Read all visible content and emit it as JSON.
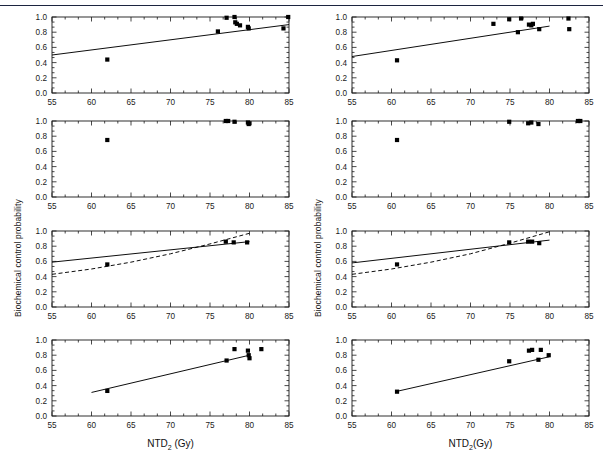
{
  "figure": {
    "ylabel": "Biochemical control probability",
    "xlabel_left": "NTD2 (Gy)",
    "xlabel_right": "NTD2(Gy)",
    "xlabel_base": "NTD",
    "xlabel_sub": "2",
    "xlabel_left_unit": " (Gy)",
    "xlabel_right_unit": "(Gy)",
    "marker_color": "#000000",
    "line_color": "#000000",
    "axis_color": "#1a1a1a",
    "top_rule_color": "#2b3555"
  },
  "axes": {
    "xlim": [
      55,
      85
    ],
    "ylim": [
      0.0,
      1.0
    ],
    "xticks": [
      55,
      60,
      65,
      70,
      75,
      80,
      85
    ],
    "xticklabels": [
      "55",
      "60",
      "65",
      "70",
      "75",
      "80",
      "85"
    ],
    "yticks": [
      0.0,
      0.2,
      0.4,
      0.6,
      0.8,
      1.0
    ],
    "yticklabels": [
      "0.0",
      "0.2",
      "0.4",
      "0.6",
      "0.8",
      "1.0"
    ],
    "minor_x_per_major": 2,
    "minor_y_per_major": 2,
    "grid": false,
    "tick_direction": "in"
  },
  "chart_data": [
    {
      "id": "panel-r1c1",
      "type": "scatter",
      "title": "",
      "xlabel": "",
      "ylabel": "Biochemical control probability",
      "xlim": [
        55,
        85
      ],
      "ylim": [
        0.0,
        1.0
      ],
      "points": [
        {
          "x": 62.0,
          "y": 0.44
        },
        {
          "x": 76.0,
          "y": 0.81
        },
        {
          "x": 77.1,
          "y": 0.99
        },
        {
          "x": 78.1,
          "y": 1.0
        },
        {
          "x": 78.2,
          "y": 0.93
        },
        {
          "x": 78.4,
          "y": 0.91
        },
        {
          "x": 78.8,
          "y": 0.89
        },
        {
          "x": 79.8,
          "y": 0.87
        },
        {
          "x": 79.9,
          "y": 0.85
        },
        {
          "x": 84.3,
          "y": 0.85
        },
        {
          "x": 84.9,
          "y": 1.0
        }
      ],
      "fit_lines": [
        {
          "style": "solid",
          "x": [
            55,
            85
          ],
          "y": [
            0.5,
            0.9
          ]
        }
      ]
    },
    {
      "id": "panel-r1c2",
      "type": "scatter",
      "title": "",
      "xlabel": "",
      "ylabel": "Biochemical control probability",
      "xlim": [
        55,
        85
      ],
      "ylim": [
        0.0,
        1.0
      ],
      "points": [
        {
          "x": 60.7,
          "y": 0.43
        },
        {
          "x": 72.9,
          "y": 0.91
        },
        {
          "x": 74.9,
          "y": 0.97
        },
        {
          "x": 76.0,
          "y": 0.8
        },
        {
          "x": 76.4,
          "y": 0.98
        },
        {
          "x": 77.4,
          "y": 0.9
        },
        {
          "x": 77.7,
          "y": 0.89
        },
        {
          "x": 77.9,
          "y": 0.91
        },
        {
          "x": 78.7,
          "y": 0.84
        },
        {
          "x": 82.4,
          "y": 0.98
        },
        {
          "x": 82.5,
          "y": 0.84
        }
      ],
      "fit_lines": [
        {
          "style": "solid",
          "x": [
            55,
            80
          ],
          "y": [
            0.48,
            0.88
          ]
        }
      ]
    },
    {
      "id": "panel-r2c1",
      "type": "scatter",
      "title": "",
      "xlabel": "",
      "ylabel": "Biochemical control probability",
      "xlim": [
        55,
        85
      ],
      "ylim": [
        0.0,
        1.0
      ],
      "points": [
        {
          "x": 62.0,
          "y": 0.75
        },
        {
          "x": 77.0,
          "y": 1.0
        },
        {
          "x": 77.3,
          "y": 1.0
        },
        {
          "x": 78.1,
          "y": 0.99
        },
        {
          "x": 79.8,
          "y": 0.98
        },
        {
          "x": 79.9,
          "y": 0.96
        },
        {
          "x": 80.0,
          "y": 0.97
        }
      ],
      "fit_lines": []
    },
    {
      "id": "panel-r2c2",
      "type": "scatter",
      "title": "",
      "xlabel": "",
      "ylabel": "Biochemical control probability",
      "xlim": [
        55,
        85
      ],
      "ylim": [
        0.0,
        1.0
      ],
      "points": [
        {
          "x": 60.7,
          "y": 0.75
        },
        {
          "x": 74.9,
          "y": 0.99
        },
        {
          "x": 77.3,
          "y": 0.97
        },
        {
          "x": 77.7,
          "y": 0.98
        },
        {
          "x": 78.6,
          "y": 0.96
        },
        {
          "x": 83.6,
          "y": 1.0
        },
        {
          "x": 83.9,
          "y": 1.0
        }
      ],
      "fit_lines": []
    },
    {
      "id": "panel-r3c1",
      "type": "scatter",
      "title": "",
      "xlabel": "",
      "ylabel": "Biochemical control probability",
      "xlim": [
        55,
        85
      ],
      "ylim": [
        0.0,
        1.0
      ],
      "points": [
        {
          "x": 62.0,
          "y": 0.56
        },
        {
          "x": 77.0,
          "y": 0.86
        },
        {
          "x": 78.0,
          "y": 0.85
        },
        {
          "x": 79.7,
          "y": 0.85
        }
      ],
      "fit_lines": [
        {
          "style": "solid",
          "x": [
            55,
            80
          ],
          "y": [
            0.59,
            0.86
          ]
        },
        {
          "style": "dashed",
          "x": [
            55,
            60,
            65,
            70,
            75,
            80
          ],
          "y": [
            0.43,
            0.5,
            0.59,
            0.7,
            0.83,
            0.97
          ]
        }
      ]
    },
    {
      "id": "panel-r3c2",
      "type": "scatter",
      "title": "",
      "xlabel": "",
      "ylabel": "Biochemical control probability",
      "xlim": [
        55,
        85
      ],
      "ylim": [
        0.0,
        1.0
      ],
      "points": [
        {
          "x": 60.7,
          "y": 0.56
        },
        {
          "x": 74.9,
          "y": 0.85
        },
        {
          "x": 77.3,
          "y": 0.86
        },
        {
          "x": 77.8,
          "y": 0.86
        },
        {
          "x": 78.7,
          "y": 0.84
        }
      ],
      "fit_lines": [
        {
          "style": "solid",
          "x": [
            55,
            80
          ],
          "y": [
            0.58,
            0.88
          ]
        },
        {
          "style": "dashed",
          "x": [
            55,
            60,
            65,
            70,
            75,
            80
          ],
          "y": [
            0.43,
            0.5,
            0.59,
            0.7,
            0.84,
            0.99
          ]
        }
      ]
    },
    {
      "id": "panel-r4c1",
      "type": "scatter",
      "title": "",
      "xlabel": "NTD2 (Gy)",
      "ylabel": "",
      "xlim": [
        55,
        85
      ],
      "ylim": [
        0.0,
        1.0
      ],
      "points": [
        {
          "x": 62.0,
          "y": 0.33
        },
        {
          "x": 77.1,
          "y": 0.73
        },
        {
          "x": 78.1,
          "y": 0.88
        },
        {
          "x": 79.8,
          "y": 0.86
        },
        {
          "x": 79.9,
          "y": 0.8
        },
        {
          "x": 80.0,
          "y": 0.76
        },
        {
          "x": 81.5,
          "y": 0.88
        }
      ],
      "fit_lines": [
        {
          "style": "solid",
          "x": [
            60,
            80
          ],
          "y": [
            0.31,
            0.8
          ]
        }
      ]
    },
    {
      "id": "panel-r4c2",
      "type": "scatter",
      "title": "",
      "xlabel": "NTD2(Gy)",
      "ylabel": "",
      "xlim": [
        55,
        85
      ],
      "ylim": [
        0.0,
        1.0
      ],
      "points": [
        {
          "x": 60.7,
          "y": 0.32
        },
        {
          "x": 74.9,
          "y": 0.72
        },
        {
          "x": 77.4,
          "y": 0.86
        },
        {
          "x": 77.8,
          "y": 0.87
        },
        {
          "x": 78.6,
          "y": 0.74
        },
        {
          "x": 78.9,
          "y": 0.87
        },
        {
          "x": 79.9,
          "y": 0.8
        }
      ],
      "fit_lines": [
        {
          "style": "solid",
          "x": [
            60.5,
            80
          ],
          "y": [
            0.32,
            0.78
          ]
        }
      ]
    }
  ]
}
